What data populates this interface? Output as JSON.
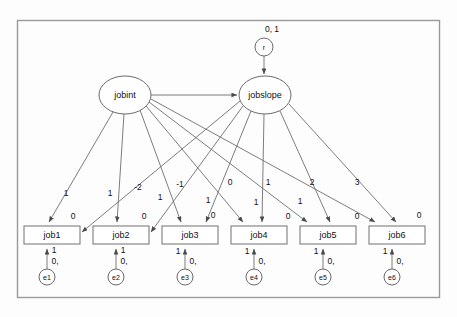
{
  "diagram": {
    "frame": {
      "label": "diagram-border"
    },
    "latent_variables": [
      {
        "id": "jobint",
        "label": "jobint",
        "shape": "ellipse",
        "cx": 125,
        "cy": 95,
        "rx": 26,
        "ry": 19
      },
      {
        "id": "jobslope",
        "label": "jobslope",
        "shape": "ellipse",
        "cx": 265,
        "cy": 95,
        "rx": 26,
        "ry": 19
      }
    ],
    "disturbance": {
      "id": "r",
      "label": "r",
      "params": "0, 1",
      "cx": 264,
      "cy": 47,
      "r": 9
    },
    "structural_path": {
      "from": "jobint",
      "to": "jobslope",
      "label": ""
    },
    "observed_variables": [
      {
        "id": "job1",
        "label": "job1",
        "intercept": "0",
        "x": 24,
        "y": 226,
        "w": 56,
        "h": 18
      },
      {
        "id": "job2",
        "label": "job2",
        "intercept": "0",
        "x": 93,
        "y": 226,
        "w": 56,
        "h": 18
      },
      {
        "id": "job3",
        "label": "job3",
        "intercept": "0",
        "x": 162,
        "y": 226,
        "w": 56,
        "h": 18
      },
      {
        "id": "job4",
        "label": "job4",
        "intercept": "0",
        "x": 231,
        "y": 226,
        "w": 56,
        "h": 18
      },
      {
        "id": "job5",
        "label": "job5",
        "intercept": "0",
        "x": 300,
        "y": 226,
        "w": 56,
        "h": 18
      },
      {
        "id": "job6",
        "label": "job6",
        "intercept": "0",
        "x": 369,
        "y": 226,
        "w": 56,
        "h": 18
      }
    ],
    "errors": [
      {
        "id": "e1",
        "label": "e1",
        "params": "0,",
        "loading": "1",
        "cx": 47,
        "cy": 277,
        "r": 8
      },
      {
        "id": "e2",
        "label": "e2",
        "params": "0,",
        "loading": "1",
        "cx": 116,
        "cy": 277,
        "r": 8
      },
      {
        "id": "e3",
        "label": "e3",
        "params": "0,",
        "loading": "1",
        "cx": 185,
        "cy": 277,
        "r": 8
      },
      {
        "id": "e4",
        "label": "e4",
        "params": "0,",
        "loading": "1",
        "cx": 254,
        "cy": 277,
        "r": 8
      },
      {
        "id": "e5",
        "label": "e5",
        "params": "0,",
        "loading": "1",
        "cx": 323,
        "cy": 277,
        "r": 8
      },
      {
        "id": "e6",
        "label": "e6",
        "params": "0,",
        "loading": "1",
        "cx": 392,
        "cy": 277,
        "r": 8
      }
    ],
    "intercept_loadings": [
      {
        "from": "jobint",
        "to": "job1",
        "label": "1",
        "lx": 77,
        "ly": 193
      },
      {
        "from": "jobint",
        "to": "job2",
        "label": "1",
        "lx": 113,
        "ly": 193
      },
      {
        "from": "jobint",
        "to": "job3",
        "label": "1",
        "lx": 163,
        "ly": 198
      },
      {
        "from": "jobint",
        "to": "job4",
        "label": "1",
        "lx": 211,
        "ly": 201
      },
      {
        "from": "jobint",
        "to": "job5",
        "label": "1",
        "lx": 260,
        "ly": 202
      },
      {
        "from": "jobint",
        "to": "job6",
        "label": "1",
        "lx": 305,
        "ly": 201
      }
    ],
    "slope_loadings": [
      {
        "from": "jobslope",
        "to": "job1",
        "label": "-2",
        "lx": 139,
        "ly": 189
      },
      {
        "from": "jobslope",
        "to": "job2",
        "label": "-1",
        "lx": 180,
        "ly": 186
      },
      {
        "from": "jobslope",
        "to": "job3",
        "label": "0",
        "lx": 230,
        "ly": 184
      },
      {
        "from": "jobslope",
        "to": "job4",
        "label": "1",
        "lx": 267,
        "ly": 184
      },
      {
        "from": "jobslope",
        "to": "job5",
        "label": "2",
        "lx": 311,
        "ly": 184
      },
      {
        "from": "jobslope",
        "to": "job6",
        "label": "3",
        "lx": 356,
        "ly": 184
      }
    ],
    "legend": {
      "notation_note": "0, 1 = mean, variance"
    }
  }
}
